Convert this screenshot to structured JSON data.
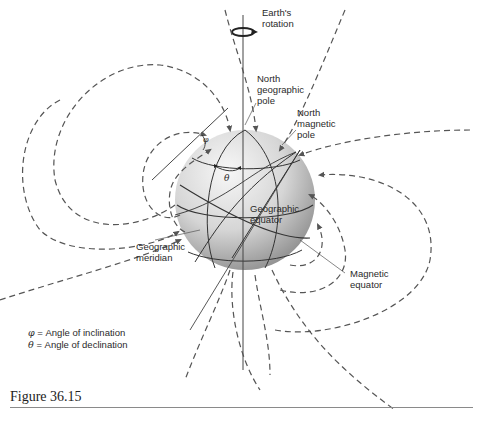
{
  "figure": {
    "caption": "Figure 36.15",
    "labels": {
      "earth_rotation": "Earth's\nrotation",
      "north_geographic_pole": "North\ngeographic\npole",
      "north_magnetic_pole": "North\nmagnetic\npole",
      "geographic_equator": "Geographic\nequator",
      "geographic_meridian": "Geographic\nmeridian",
      "magnetic_equator": "Magnetic\nequator",
      "phi_symbol": "φ",
      "theta_symbol": "θ"
    },
    "legend": [
      {
        "symbol": "φ",
        "text": "= Angle of inclination"
      },
      {
        "symbol": "θ",
        "text": "= Angle of declination"
      }
    ],
    "colors": {
      "sphere_light": "#f4f4f4",
      "sphere_dark": "#9a9a9a",
      "field_line": "#555555",
      "axis_line": "#333333",
      "text": "#2a2a2a"
    }
  }
}
